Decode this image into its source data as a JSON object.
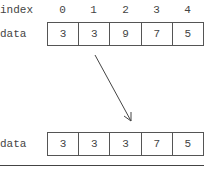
{
  "labels": {
    "index": "index",
    "data_top": "data",
    "data_bottom": "data"
  },
  "indices": [
    "0",
    "1",
    "2",
    "3",
    "4"
  ],
  "rows": {
    "before": [
      "3",
      "3",
      "9",
      "7",
      "5"
    ],
    "after": [
      "3",
      "3",
      "3",
      "7",
      "5"
    ]
  },
  "arrow": {
    "from": [
      95,
      55
    ],
    "to": [
      131,
      121
    ],
    "color": "#444444"
  }
}
